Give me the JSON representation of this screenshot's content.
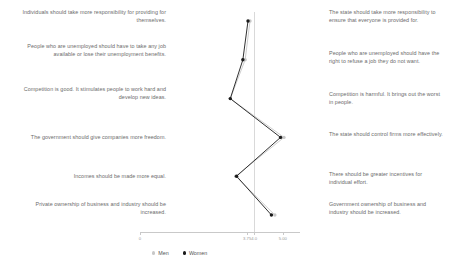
{
  "chart_data": {
    "type": "line",
    "title": "",
    "xlabel": "",
    "ylabel": "",
    "orientation": "horizontal",
    "grid": true,
    "gridline_at": 4.0,
    "legend_position": "bottom",
    "axis": {
      "ticks": [
        0,
        3.75,
        4.0,
        5.0
      ],
      "tick_labels": [
        "0",
        "3.75",
        "4.0",
        "5.00"
      ],
      "xlim": [
        0,
        5.6
      ]
    },
    "categories": [
      "Individuals should take more responsibility for providing for themselves. / The state should take more responsibility to ensure that everyone is provided for.",
      "People who are unemployed should have to take any job available or lose their unemployment benefits. / People who are unemployed should have the right to refuse a job they do not want.",
      "Competition is good. It stimulates people to work hard and develop new ideas. / Competition is harmful. It brings out the worst in people.",
      "The government should give companies more freedom. / The state should control firms more effectively.",
      "Incomes should be made more equal. / There should be greater incentives for individual effort.",
      "Private ownership of business and industry should be increased. / Government ownership of business and industry should be increased."
    ],
    "left_statements": [
      "Individuals should take more responsibility for providing for themselves.",
      "People who are unemployed should have to take any job available or lose their unemployment benefits.",
      "Competition is good. It stimulates people to work hard and develop new ideas.",
      "The government should give companies more freedom.",
      "Incomes should be made more equal.",
      "Private ownership of business and industry should be increased."
    ],
    "right_statements": [
      "The state should take more responsibility to ensure that everyone is provided for.",
      "People who are unemployed should have the right to refuse a job they do not want.",
      "Competition is harmful. It brings out the worst in people.",
      "The state should control firms more effectively.",
      "There should be greater incentives for individual effort.",
      "Government ownership of business and industry should be increased."
    ],
    "series": [
      {
        "name": "Men",
        "color": "#c8c8c8",
        "values": [
          3.85,
          3.68,
          3.16,
          5.04,
          3.35,
          4.72
        ]
      },
      {
        "name": "Women",
        "color": "#1a1a1a",
        "values": [
          3.78,
          3.6,
          3.16,
          4.92,
          3.38,
          4.6
        ]
      }
    ]
  },
  "legend": {
    "items": [
      {
        "label": "Men",
        "color": "#c8c8c8"
      },
      {
        "label": "Women",
        "color": "#1a1a1a"
      }
    ]
  }
}
